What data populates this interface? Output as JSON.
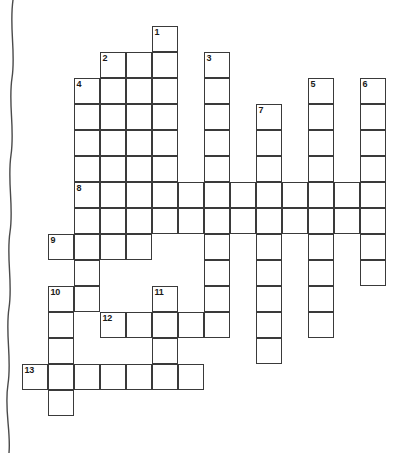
{
  "puzzle": {
    "title": "Crossword Puzzle Grid",
    "type": "crossword",
    "cell_size": 26,
    "origin_x": 22,
    "origin_y": 26,
    "grid_columns": 14,
    "grid_rows": 16,
    "colors": {
      "cell_border": "#3a3a3a",
      "cell_fill": "#ffffff",
      "number_text": "#1a1a1a",
      "page_background": "#ffffff",
      "edge_line": "#4a4a4a"
    },
    "numbers": [
      {
        "label": "1",
        "col": 5,
        "row": 0
      },
      {
        "label": "2",
        "col": 3,
        "row": 1
      },
      {
        "label": "3",
        "col": 7,
        "row": 1
      },
      {
        "label": "4",
        "col": 2,
        "row": 2
      },
      {
        "label": "5",
        "col": 11,
        "row": 2
      },
      {
        "label": "6",
        "col": 13,
        "row": 2
      },
      {
        "label": "7",
        "col": 9,
        "row": 3
      },
      {
        "label": "8",
        "col": 2,
        "row": 6
      },
      {
        "label": "9",
        "col": 1,
        "row": 8
      },
      {
        "label": "10",
        "col": 1,
        "row": 10
      },
      {
        "label": "11",
        "col": 5,
        "row": 10
      },
      {
        "label": "12",
        "col": 3,
        "row": 11
      },
      {
        "label": "13",
        "col": 0,
        "row": 13
      }
    ],
    "cells": [
      {
        "col": 5,
        "row": 0
      },
      {
        "col": 3,
        "row": 1
      },
      {
        "col": 4,
        "row": 1
      },
      {
        "col": 5,
        "row": 1
      },
      {
        "col": 7,
        "row": 1
      },
      {
        "col": 2,
        "row": 2
      },
      {
        "col": 3,
        "row": 2
      },
      {
        "col": 4,
        "row": 2
      },
      {
        "col": 5,
        "row": 2
      },
      {
        "col": 7,
        "row": 2
      },
      {
        "col": 11,
        "row": 2
      },
      {
        "col": 13,
        "row": 2
      },
      {
        "col": 2,
        "row": 3
      },
      {
        "col": 3,
        "row": 3
      },
      {
        "col": 4,
        "row": 3
      },
      {
        "col": 5,
        "row": 3
      },
      {
        "col": 7,
        "row": 3
      },
      {
        "col": 9,
        "row": 3
      },
      {
        "col": 11,
        "row": 3
      },
      {
        "col": 13,
        "row": 3
      },
      {
        "col": 2,
        "row": 4
      },
      {
        "col": 3,
        "row": 4
      },
      {
        "col": 4,
        "row": 4
      },
      {
        "col": 5,
        "row": 4
      },
      {
        "col": 7,
        "row": 4
      },
      {
        "col": 9,
        "row": 4
      },
      {
        "col": 11,
        "row": 4
      },
      {
        "col": 13,
        "row": 4
      },
      {
        "col": 2,
        "row": 5
      },
      {
        "col": 3,
        "row": 5
      },
      {
        "col": 4,
        "row": 5
      },
      {
        "col": 5,
        "row": 5
      },
      {
        "col": 7,
        "row": 5
      },
      {
        "col": 9,
        "row": 5
      },
      {
        "col": 11,
        "row": 5
      },
      {
        "col": 13,
        "row": 5
      },
      {
        "col": 2,
        "row": 6
      },
      {
        "col": 3,
        "row": 6
      },
      {
        "col": 4,
        "row": 6
      },
      {
        "col": 5,
        "row": 6
      },
      {
        "col": 6,
        "row": 6
      },
      {
        "col": 7,
        "row": 6
      },
      {
        "col": 8,
        "row": 6
      },
      {
        "col": 9,
        "row": 6
      },
      {
        "col": 10,
        "row": 6
      },
      {
        "col": 11,
        "row": 6
      },
      {
        "col": 12,
        "row": 6
      },
      {
        "col": 13,
        "row": 6
      },
      {
        "col": 2,
        "row": 7
      },
      {
        "col": 3,
        "row": 7
      },
      {
        "col": 4,
        "row": 7
      },
      {
        "col": 5,
        "row": 7
      },
      {
        "col": 6,
        "row": 7
      },
      {
        "col": 7,
        "row": 7
      },
      {
        "col": 8,
        "row": 7
      },
      {
        "col": 9,
        "row": 7
      },
      {
        "col": 10,
        "row": 7
      },
      {
        "col": 11,
        "row": 7
      },
      {
        "col": 12,
        "row": 7
      },
      {
        "col": 13,
        "row": 7
      },
      {
        "col": 1,
        "row": 8
      },
      {
        "col": 2,
        "row": 8
      },
      {
        "col": 3,
        "row": 8
      },
      {
        "col": 4,
        "row": 8
      },
      {
        "col": 7,
        "row": 8
      },
      {
        "col": 9,
        "row": 8
      },
      {
        "col": 11,
        "row": 8
      },
      {
        "col": 13,
        "row": 8
      },
      {
        "col": 2,
        "row": 9
      },
      {
        "col": 7,
        "row": 9
      },
      {
        "col": 9,
        "row": 9
      },
      {
        "col": 11,
        "row": 9
      },
      {
        "col": 13,
        "row": 9
      },
      {
        "col": 1,
        "row": 10
      },
      {
        "col": 2,
        "row": 10
      },
      {
        "col": 5,
        "row": 10
      },
      {
        "col": 7,
        "row": 10
      },
      {
        "col": 9,
        "row": 10
      },
      {
        "col": 11,
        "row": 10
      },
      {
        "col": 1,
        "row": 11
      },
      {
        "col": 3,
        "row": 11
      },
      {
        "col": 4,
        "row": 11
      },
      {
        "col": 5,
        "row": 11
      },
      {
        "col": 6,
        "row": 11
      },
      {
        "col": 7,
        "row": 11
      },
      {
        "col": 9,
        "row": 11
      },
      {
        "col": 11,
        "row": 11
      },
      {
        "col": 1,
        "row": 12
      },
      {
        "col": 5,
        "row": 12
      },
      {
        "col": 9,
        "row": 12
      },
      {
        "col": 0,
        "row": 13
      },
      {
        "col": 1,
        "row": 13
      },
      {
        "col": 2,
        "row": 13
      },
      {
        "col": 3,
        "row": 13
      },
      {
        "col": 4,
        "row": 13
      },
      {
        "col": 5,
        "row": 13
      },
      {
        "col": 6,
        "row": 13
      },
      {
        "col": 1,
        "row": 14
      }
    ]
  }
}
